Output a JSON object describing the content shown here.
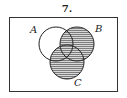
{
  "title": "7.",
  "diagram": {
    "type": "venn",
    "sets": [
      "A",
      "B",
      "C"
    ],
    "shaded_region": "B ∪ C",
    "shading": "horizontal lines",
    "colors": {
      "outline": "#222222",
      "shading": "#555555",
      "background": "#ffffff"
    }
  },
  "labels": {
    "a": "A",
    "b": "B",
    "c": "C"
  }
}
